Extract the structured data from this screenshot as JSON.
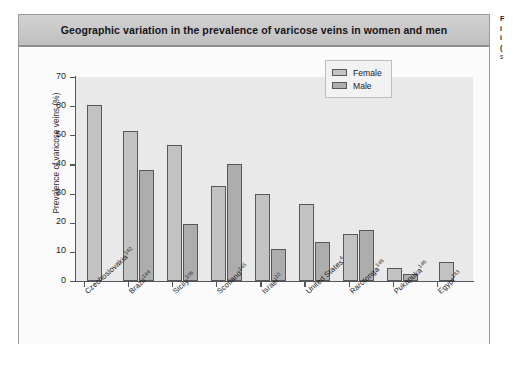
{
  "figure": {
    "title": "Geographic variation in the prevalence of varicose veins in women and men"
  },
  "legend": {
    "female_label": "Female",
    "male_label": "Male",
    "female_color": "#c2c2c2",
    "male_color": "#adadad"
  },
  "axes": {
    "y_title": "Prevalence of varicose veins (%)",
    "y_ticks": [
      "0",
      "10",
      "20",
      "30",
      "40",
      "50",
      "60",
      "70"
    ]
  },
  "categories": [
    {
      "name": "Czechoslovakia",
      "ref": "142"
    },
    {
      "name": "Brazil",
      "ref": "144"
    },
    {
      "name": "Sicily",
      "ref": "106"
    },
    {
      "name": "Scotland",
      "ref": "145"
    },
    {
      "name": "Israel",
      "ref": "10"
    },
    {
      "name": "United States",
      "ref": "4"
    },
    {
      "name": "Rarotonga",
      "ref": "146"
    },
    {
      "name": "Pukapuka",
      "ref": "146"
    },
    {
      "name": "Egypt",
      "ref": "143"
    }
  ],
  "side_caption": {
    "lines": [
      "F",
      "i",
      "i",
      "(",
      "s"
    ]
  },
  "chart_data": {
    "type": "bar",
    "title": "Geographic variation in the prevalence of varicose veins in women and men",
    "xlabel": "",
    "ylabel": "Prevalence of varicose veins (%)",
    "ylim": [
      0,
      70
    ],
    "ytick_step": 10,
    "grid": false,
    "legend_position": "top-right",
    "categories": [
      "Czechoslovakia142",
      "Brazil144",
      "Sicily106",
      "Scotland145",
      "Israel10",
      "United States4",
      "Rarotonga146",
      "Pukapuka146",
      "Egypt143"
    ],
    "series": [
      {
        "name": "Female",
        "color": "#c2c2c2",
        "values": [
          60.5,
          51.5,
          46.5,
          32.5,
          30.0,
          26.5,
          16.0,
          4.5,
          6.5
        ]
      },
      {
        "name": "Male",
        "color": "#adadad",
        "values": [
          null,
          38.0,
          19.5,
          40.0,
          11.0,
          13.5,
          17.5,
          2.5,
          null
        ]
      }
    ]
  }
}
